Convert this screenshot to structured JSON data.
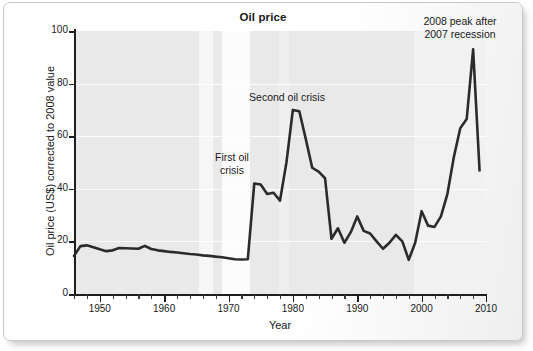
{
  "chart_data": {
    "type": "line",
    "title": "Oil price",
    "xlabel": "Year",
    "ylabel": "Oil price (US$) corrected to 2008 value",
    "xlim": [
      1946,
      2010
    ],
    "ylim": [
      0,
      100
    ],
    "grid": true,
    "legend": "none",
    "x_ticks": [
      1950,
      1960,
      1970,
      1980,
      1990,
      2000,
      2010
    ],
    "x_minor_tick_interval": 2,
    "y_ticks": [
      0,
      20,
      40,
      60,
      80,
      100
    ],
    "line_color": "#2b2b2b",
    "plot_background": "#e9e9e9",
    "series": [
      {
        "name": "Oil price (US$, corrected to 2008 value)",
        "x": [
          1946,
          1947,
          1948,
          1949,
          1950,
          1951,
          1952,
          1953,
          1954,
          1955,
          1956,
          1957,
          1958,
          1959,
          1960,
          1961,
          1962,
          1963,
          1964,
          1965,
          1966,
          1967,
          1968,
          1969,
          1970,
          1971,
          1972,
          1973,
          1974,
          1975,
          1976,
          1977,
          1978,
          1979,
          1980,
          1981,
          1982,
          1983,
          1984,
          1985,
          1986,
          1987,
          1988,
          1989,
          1990,
          1991,
          1992,
          1993,
          1994,
          1995,
          1996,
          1997,
          1998,
          1999,
          2000,
          2001,
          2002,
          2003,
          2004,
          2005,
          2006,
          2007,
          2008,
          2009
        ],
        "values": [
          14.5,
          18.2,
          18.5,
          17.8,
          17.0,
          16.3,
          16.6,
          17.5,
          17.4,
          17.3,
          17.2,
          18.3,
          17.1,
          16.6,
          16.3,
          16.0,
          15.8,
          15.5,
          15.2,
          15.0,
          14.7,
          14.5,
          14.2,
          14.0,
          13.6,
          13.2,
          13.1,
          13.2,
          42.0,
          41.6,
          38.0,
          38.5,
          35.5,
          50.0,
          70.0,
          69.5,
          59.0,
          48.0,
          46.5,
          44.0,
          21.0,
          25.0,
          19.5,
          23.5,
          29.5,
          24.0,
          23.0,
          20.0,
          17.2,
          19.5,
          22.5,
          20.0,
          13.0,
          19.5,
          31.5,
          26.0,
          25.5,
          29.5,
          38.0,
          52.0,
          63.0,
          66.5,
          93.0,
          47.0
        ]
      }
    ],
    "annotations": [
      {
        "id": "first-oil-crisis",
        "text": "First oil\ncrisis",
        "near_year": 1973
      },
      {
        "id": "second-oil-crisis",
        "text": "Second oil crisis",
        "near_year": 1980
      },
      {
        "id": "2008-peak",
        "text": "2008 peak after\n2007 recession",
        "near_year": 2008
      }
    ]
  }
}
